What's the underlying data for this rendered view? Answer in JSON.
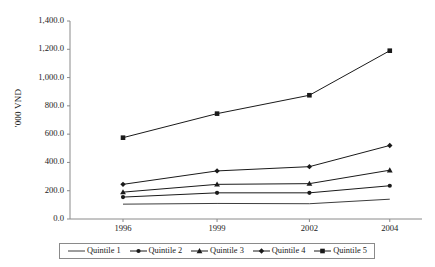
{
  "chart_data": {
    "type": "line",
    "title": "",
    "subtitle": "",
    "xlabel": "",
    "ylabel": "'000 VND",
    "categories": [
      "1996",
      "1999",
      "2002",
      "2004"
    ],
    "x_tick_labels": [
      "1996",
      "1999",
      "2002",
      "2004"
    ],
    "y_tick_labels": [
      "0.0",
      "200.0",
      "400.0",
      "600.0",
      "800.0",
      "1,000.0",
      "1,200.0",
      "1,400.0"
    ],
    "y_tick_values": [
      0,
      200,
      400,
      600,
      800,
      1000,
      1200,
      1400
    ],
    "ylim": [
      0,
      1400
    ],
    "grid": false,
    "legend_position": "bottom",
    "series": [
      {
        "name": "Quintile 1",
        "marker": "none",
        "color": "#3d3d3d",
        "values": [
          105,
          110,
          108,
          140
        ]
      },
      {
        "name": "Quintile 2",
        "marker": "circle",
        "color": "#1a1a1a",
        "values": [
          155,
          185,
          185,
          235
        ]
      },
      {
        "name": "Quintile 3",
        "marker": "triangle",
        "color": "#1a1a1a",
        "values": [
          190,
          245,
          250,
          345
        ]
      },
      {
        "name": "Quintile 4",
        "marker": "diamond",
        "color": "#1a1a1a",
        "values": [
          245,
          340,
          370,
          520
        ]
      },
      {
        "name": "Quintile 5",
        "marker": "square",
        "color": "#1a1a1a",
        "values": [
          575,
          745,
          875,
          1190
        ]
      }
    ]
  },
  "axis": {
    "line_color": "#8a8a8a"
  }
}
